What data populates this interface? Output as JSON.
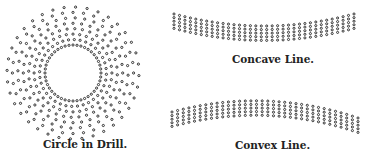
{
  "figures": [
    {
      "id": "circle",
      "caption": "Circle in Drill.",
      "center": [
        73,
        73
      ],
      "inner_radius": 28,
      "outer_radius": 66,
      "rings": 8,
      "spokes": 36
    },
    {
      "id": "concave",
      "caption": "Concave Line.",
      "x_start": 174,
      "x_end": 354,
      "rows": 5,
      "sag": 12
    },
    {
      "id": "convex",
      "caption": "Convex Line.",
      "x_start": 172,
      "x_end": 358,
      "rows": 5,
      "sag": -14
    }
  ],
  "colors": {
    "dot": "#333333",
    "background": "#ffffff"
  }
}
